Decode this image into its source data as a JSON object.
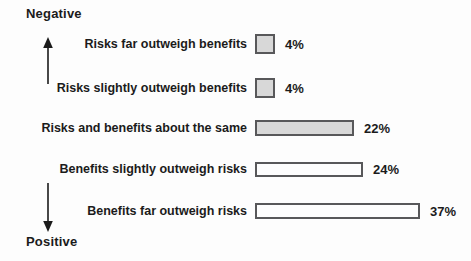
{
  "figure": {
    "axis": {
      "top_label": "Negative",
      "bottom_label": "Positive"
    },
    "rows": [
      {
        "label": "Risks far outweigh benefits",
        "value": 4,
        "pct": "4%",
        "fill": "gray"
      },
      {
        "label": "Risks slightly outweigh benefits",
        "value": 4,
        "pct": "4%",
        "fill": "gray"
      },
      {
        "label": "Risks and benefits about the same",
        "value": 22,
        "pct": "22%",
        "fill": "gray"
      },
      {
        "label": "Benefits slightly outweigh risks",
        "value": 24,
        "pct": "24%",
        "fill": "white"
      },
      {
        "label": "Benefits far outweigh risks",
        "value": 37,
        "pct": "37%",
        "fill": "white"
      }
    ],
    "colors": {
      "background": "#fdfdfd",
      "bar_gray_fill": "#d8d8d8",
      "bar_white_fill": "#fdfdfd",
      "bar_border": "#58585a",
      "text": "#1b1b1b"
    }
  },
  "chart_data": {
    "type": "bar",
    "orientation": "horizontal",
    "title": "",
    "xlabel": "",
    "ylabel": "",
    "categories": [
      "Risks far outweigh benefits",
      "Risks slightly outweigh benefits",
      "Risks and benefits about the same",
      "Benefits slightly outweigh risks",
      "Benefits far outweigh risks"
    ],
    "values": [
      4,
      4,
      22,
      24,
      37
    ],
    "value_labels": [
      "4%",
      "4%",
      "22%",
      "24%",
      "37%"
    ],
    "bar_fill": [
      "shaded",
      "shaded",
      "shaded",
      "white",
      "white"
    ],
    "axis_annotations": {
      "top": "Negative",
      "bottom": "Positive"
    },
    "xlim": [
      0,
      40
    ],
    "grid": false,
    "legend": "none"
  }
}
